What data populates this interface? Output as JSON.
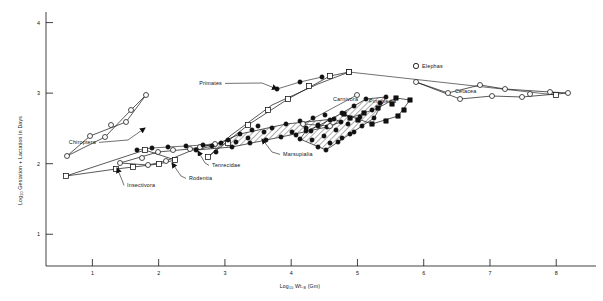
{
  "figure": {
    "domain": "scientific-scatter-plot",
    "background": "#ffffff",
    "ink": "#111111",
    "width": 603,
    "height": 301
  },
  "chart_data": {
    "type": "scatter",
    "title": "",
    "xlabel": "Log10 Wt. B (Gm)",
    "xlabel_parts": {
      "pre": "Log",
      "sub1": "10",
      "mid": " Wt.",
      "sub2": "B",
      "post": " (Gm)"
    },
    "ylabel": "Log10 Gestation + Lactation in Days",
    "ylabel_parts": {
      "pre": "Log",
      "sub": "10",
      "post": " Gestation + Lactation in Days"
    },
    "xlim": [
      0.3,
      8.6
    ],
    "ylim": [
      0.55,
      4.15
    ],
    "xticks": [
      1,
      2,
      3,
      4,
      5,
      6,
      7,
      8
    ],
    "yticks": [
      1,
      2,
      3,
      4
    ],
    "grid": false,
    "legend_position": "none",
    "marker_styles": {
      "open_circle": "open circle",
      "filled_circle": "filled circle",
      "open_square": "open square",
      "filled_square": "filled square"
    },
    "annotations": [
      {
        "label": "Chiroptera",
        "lx": 96,
        "ly": 144,
        "anchor": "end",
        "tip": [
          145,
          128
        ],
        "elbow": [
          128,
          140
        ]
      },
      {
        "label": "Insectivora",
        "lx": 127,
        "ly": 187,
        "anchor": "start",
        "tip": [
          117,
          168
        ],
        "elbow": [
          122,
          180
        ]
      },
      {
        "label": "Rodentia",
        "lx": 189,
        "ly": 180,
        "anchor": "start",
        "tip": [
          172,
          163
        ],
        "elbow": [
          181,
          176
        ]
      },
      {
        "label": "Tenrecidae",
        "lx": 212,
        "ly": 167,
        "anchor": "start",
        "tip": [
          198,
          151
        ],
        "elbow": [
          205,
          163
        ]
      },
      {
        "label": "Primates",
        "lx": 222,
        "ly": 85,
        "anchor": "end",
        "tip": [
          277,
          89
        ],
        "elbow": [
          262,
          83
        ]
      },
      {
        "label": "Marsupialia",
        "lx": 283,
        "ly": 156,
        "anchor": "start",
        "tip": [
          262,
          139
        ],
        "elbow": [
          272,
          152
        ]
      },
      {
        "label": "Carnivora",
        "lx": 333,
        "ly": 101,
        "anchor": "start",
        "tip": null,
        "elbow": null
      },
      {
        "label": "Pinnipedia",
        "lx": 369,
        "ly": 103,
        "anchor": "start",
        "tip": null,
        "elbow": null
      },
      {
        "label": "Cetacea",
        "lx": 455,
        "ly": 93,
        "anchor": "start",
        "tip": null,
        "elbow": null
      },
      {
        "label": "Elephas",
        "lx": 422,
        "ly": 68,
        "anchor": "start",
        "tip": null,
        "elbow": null
      }
    ],
    "elephas_marker": {
      "x": 416,
      "y": 66,
      "style": "open_circle"
    },
    "series": [
      {
        "name": "Chiroptera",
        "marker": "open_circle",
        "points": [
          [
            67,
            156
          ],
          [
            90,
            136
          ],
          [
            111,
            125
          ],
          [
            126,
            122
          ],
          [
            146,
            95
          ],
          [
            105,
            137
          ],
          [
            131,
            110
          ]
        ],
        "hull": [
          [
            67,
            156
          ],
          [
            105,
            137
          ],
          [
            131,
            110
          ],
          [
            146,
            95
          ],
          [
            126,
            122
          ],
          [
            90,
            136
          ]
        ]
      },
      {
        "name": "Insectivora",
        "marker": "open_square",
        "points": [
          [
            66,
            176
          ],
          [
            116,
            169
          ],
          [
            133,
            167
          ],
          [
            159,
            164
          ],
          [
            145,
            150
          ],
          [
            175,
            160
          ]
        ],
        "hull": [
          [
            66,
            176
          ],
          [
            116,
            169
          ],
          [
            159,
            164
          ],
          [
            175,
            160
          ],
          [
            145,
            150
          ]
        ]
      },
      {
        "name": "Rodentia",
        "marker": "open_circle",
        "points": [
          [
            120,
            163
          ],
          [
            142,
            158
          ],
          [
            158,
            152
          ],
          [
            173,
            150
          ],
          [
            190,
            149
          ],
          [
            148,
            165
          ],
          [
            166,
            161
          ],
          [
            200,
            147
          ],
          [
            215,
            144
          ]
        ],
        "hull": [
          [
            120,
            163
          ],
          [
            148,
            165
          ],
          [
            166,
            161
          ],
          [
            200,
            147
          ],
          [
            215,
            144
          ],
          [
            190,
            149
          ],
          [
            158,
            152
          ]
        ]
      },
      {
        "name": "Tenrecidae",
        "marker": "filled_circle",
        "points": [
          [
            137,
            150
          ],
          [
            152,
            148
          ],
          [
            168,
            147
          ],
          [
            186,
            146
          ],
          [
            203,
            145
          ],
          [
            221,
            143
          ]
        ],
        "hull": null
      },
      {
        "name": "Primates",
        "marker": "open_square",
        "points": [
          [
            208,
            157
          ],
          [
            228,
            143
          ],
          [
            248,
            125
          ],
          [
            268,
            110
          ],
          [
            288,
            99
          ],
          [
            309,
            86
          ],
          [
            330,
            76
          ],
          [
            349,
            72
          ]
        ],
        "hull": [
          [
            208,
            157
          ],
          [
            248,
            125
          ],
          [
            288,
            99
          ],
          [
            330,
            76
          ],
          [
            349,
            72
          ],
          [
            318,
            84
          ],
          [
            272,
            105
          ],
          [
            230,
            136
          ]
        ]
      },
      {
        "name": "Primates-filled",
        "marker": "filled_circle",
        "points": [
          [
            277,
            89
          ],
          [
            300,
            82
          ],
          [
            322,
            77
          ]
        ],
        "hull": null
      },
      {
        "name": "Marsupialia",
        "marker": "filled_circle",
        "points": [
          [
            196,
            150
          ],
          [
            212,
            146
          ],
          [
            228,
            140
          ],
          [
            240,
            134
          ],
          [
            252,
            130
          ],
          [
            236,
            142
          ],
          [
            248,
            138
          ],
          [
            264,
            132
          ],
          [
            258,
            126
          ],
          [
            272,
            128
          ],
          [
            286,
            124
          ],
          [
            300,
            121
          ],
          [
            313,
            118
          ],
          [
            325,
            115
          ],
          [
            292,
            132
          ],
          [
            306,
            128
          ],
          [
            318,
            125
          ],
          [
            334,
            119
          ],
          [
            250,
            143
          ],
          [
            266,
            140
          ],
          [
            281,
            137
          ],
          [
            296,
            135
          ],
          [
            311,
            131
          ],
          [
            327,
            127
          ],
          [
            341,
            122
          ],
          [
            232,
            147
          ],
          [
            216,
            152
          ]
        ],
        "hull": [
          [
            196,
            150
          ],
          [
            232,
            147
          ],
          [
            281,
            137
          ],
          [
            327,
            127
          ],
          [
            341,
            122
          ],
          [
            334,
            119
          ],
          [
            286,
            124
          ],
          [
            240,
            134
          ],
          [
            212,
            146
          ]
        ]
      },
      {
        "name": "Carnivora",
        "marker": "filled_circle",
        "points": [
          [
            306,
            131
          ],
          [
            318,
            126
          ],
          [
            330,
            120
          ],
          [
            342,
            113
          ],
          [
            354,
            106
          ],
          [
            366,
            99
          ],
          [
            312,
            140
          ],
          [
            324,
            136
          ],
          [
            336,
            130
          ],
          [
            348,
            124
          ],
          [
            360,
            117
          ],
          [
            372,
            110
          ],
          [
            318,
            147
          ],
          [
            330,
            143
          ],
          [
            342,
            138
          ],
          [
            354,
            132
          ],
          [
            300,
            139
          ],
          [
            380,
            103
          ],
          [
            386,
            97
          ],
          [
            374,
            118
          ],
          [
            362,
            126
          ],
          [
            350,
            134
          ],
          [
            338,
            142
          ],
          [
            326,
            150
          ]
        ],
        "hull": [
          [
            300,
            139
          ],
          [
            326,
            150
          ],
          [
            350,
            134
          ],
          [
            374,
            118
          ],
          [
            386,
            97
          ],
          [
            366,
            99
          ],
          [
            342,
            113
          ],
          [
            318,
            126
          ],
          [
            306,
            131
          ]
        ]
      },
      {
        "name": "Carnivora-open",
        "marker": "open_circle",
        "points": [
          [
            330,
            126
          ],
          [
            303,
            124
          ],
          [
            357,
            95
          ]
        ],
        "hull": null
      },
      {
        "name": "Pinnipedia",
        "marker": "filled_square",
        "points": [
          [
            344,
            114
          ],
          [
            358,
            120
          ],
          [
            372,
            124
          ],
          [
            386,
            121
          ],
          [
            398,
            116
          ],
          [
            392,
            104
          ],
          [
            378,
            108
          ],
          [
            364,
            113
          ],
          [
            350,
            118
          ],
          [
            404,
            110
          ],
          [
            410,
            100
          ],
          [
            396,
            98
          ]
        ],
        "hull": [
          [
            344,
            114
          ],
          [
            372,
            124
          ],
          [
            398,
            116
          ],
          [
            410,
            100
          ],
          [
            396,
            98
          ],
          [
            378,
            108
          ],
          [
            350,
            118
          ]
        ]
      },
      {
        "name": "Elephas",
        "marker": "open_circle",
        "points": [
          [
            416,
            66
          ]
        ],
        "hull": null
      },
      {
        "name": "Cetacea",
        "marker": "open_circle",
        "points": [
          [
            416,
            82
          ],
          [
            448,
            93
          ],
          [
            480,
            85
          ],
          [
            505,
            89
          ],
          [
            530,
            94
          ],
          [
            550,
            92
          ],
          [
            568,
            93
          ],
          [
            460,
            99
          ],
          [
            492,
            96
          ],
          [
            522,
            97
          ]
        ],
        "hull": [
          [
            416,
            82
          ],
          [
            460,
            99
          ],
          [
            492,
            96
          ],
          [
            522,
            97
          ],
          [
            568,
            93
          ],
          [
            550,
            92
          ],
          [
            505,
            89
          ],
          [
            480,
            85
          ],
          [
            448,
            93
          ]
        ]
      },
      {
        "name": "Cetacea-square",
        "marker": "open_square",
        "points": [
          [
            556,
            95
          ],
          [
            349,
            72
          ]
        ],
        "hull": null
      }
    ]
  }
}
